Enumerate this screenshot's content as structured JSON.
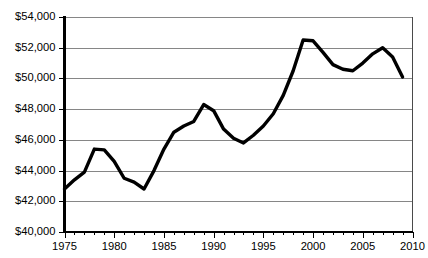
{
  "chart_data": {
    "type": "line",
    "title": "",
    "subtitle": "",
    "xlabel": "",
    "ylabel": "",
    "xlim": [
      1975,
      2010
    ],
    "ylim": [
      40000,
      54000
    ],
    "grid": true,
    "grid_axis": "y",
    "legend": false,
    "legend_position": "none",
    "line_color": "#000000",
    "x_tick_labels": [
      "1975",
      "1980",
      "1985",
      "1990",
      "1995",
      "2000",
      "2005",
      "2010"
    ],
    "x_tick_values": [
      1975,
      1980,
      1985,
      1990,
      1995,
      2000,
      2005,
      2010
    ],
    "y_tick_labels": [
      "$40,000",
      "$42,000",
      "$44,000",
      "$46,000",
      "$48,000",
      "$50,000",
      "$52,000",
      "$54,000"
    ],
    "y_tick_values": [
      40000,
      42000,
      44000,
      46000,
      48000,
      50000,
      52000,
      54000
    ],
    "x": [
      1975,
      1976,
      1977,
      1978,
      1979,
      1980,
      1981,
      1982,
      1983,
      1984,
      1985,
      1986,
      1987,
      1988,
      1989,
      1990,
      1991,
      1992,
      1993,
      1994,
      1995,
      1996,
      1997,
      1998,
      1999,
      2000,
      2001,
      2002,
      2003,
      2004,
      2005,
      2006,
      2007,
      2008,
      2009
    ],
    "values": [
      42800,
      43400,
      43900,
      45400,
      45350,
      44600,
      43500,
      43250,
      42800,
      44000,
      45400,
      46500,
      46900,
      47200,
      48300,
      47900,
      46700,
      46100,
      45800,
      46300,
      46900,
      47700,
      48900,
      50500,
      52500,
      52450,
      51700,
      50900,
      50600,
      50500,
      51000,
      51600,
      52000,
      51400,
      50100
    ],
    "series": [
      {
        "name": "Median household income",
        "values": [
          42800,
          43400,
          43900,
          45400,
          45350,
          44600,
          43500,
          43250,
          42800,
          44000,
          45400,
          46500,
          46900,
          47200,
          48300,
          47900,
          46700,
          46100,
          45800,
          46300,
          46900,
          47700,
          48900,
          50500,
          52500,
          52450,
          51700,
          50900,
          50600,
          50500,
          51000,
          51600,
          52000,
          51400,
          50100
        ]
      }
    ],
    "annotations": []
  },
  "caption": {
    "cutoff_text": ""
  }
}
